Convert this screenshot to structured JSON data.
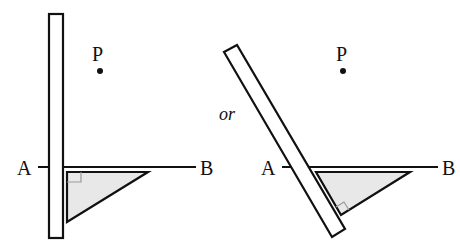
{
  "diagram": {
    "connector_text": "or",
    "colors": {
      "stroke": "#111111",
      "triangle_fill": "#e6e6e6",
      "right_angle_marker": "#999999"
    },
    "left_figure": {
      "point_label": "P",
      "line_start_label": "A",
      "line_end_label": "B",
      "ruler_orientation": "vertical",
      "set_square": "right-angle triangle against ruler, leg along AB"
    },
    "right_figure": {
      "point_label": "P",
      "line_start_label": "A",
      "line_end_label": "B",
      "ruler_orientation": "tilted",
      "set_square": "right-angle triangle against tilted ruler, hypotenuse-side edge along AB"
    }
  }
}
